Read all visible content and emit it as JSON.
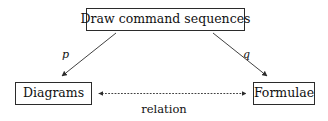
{
  "diagram": {
    "nodes": [
      {
        "id": "source",
        "label": "Draw command sequences"
      },
      {
        "id": "diagrams",
        "label": "Diagrams"
      },
      {
        "id": "formulae",
        "label": "Formulae"
      }
    ],
    "edges": [
      {
        "id": "p-edge",
        "label": "p",
        "from": "source",
        "to": "diagrams",
        "style": "solid",
        "arrow": "forward"
      },
      {
        "id": "q-edge",
        "label": "q",
        "from": "source",
        "to": "formulae",
        "style": "solid",
        "arrow": "forward"
      },
      {
        "id": "relation-edge",
        "label": "relation",
        "from": "diagrams",
        "to": "formulae",
        "style": "dotted",
        "arrow": "both"
      }
    ],
    "colors": {
      "stroke": "#2b2b2b",
      "text": "#111111",
      "background": "#ffffff"
    }
  }
}
